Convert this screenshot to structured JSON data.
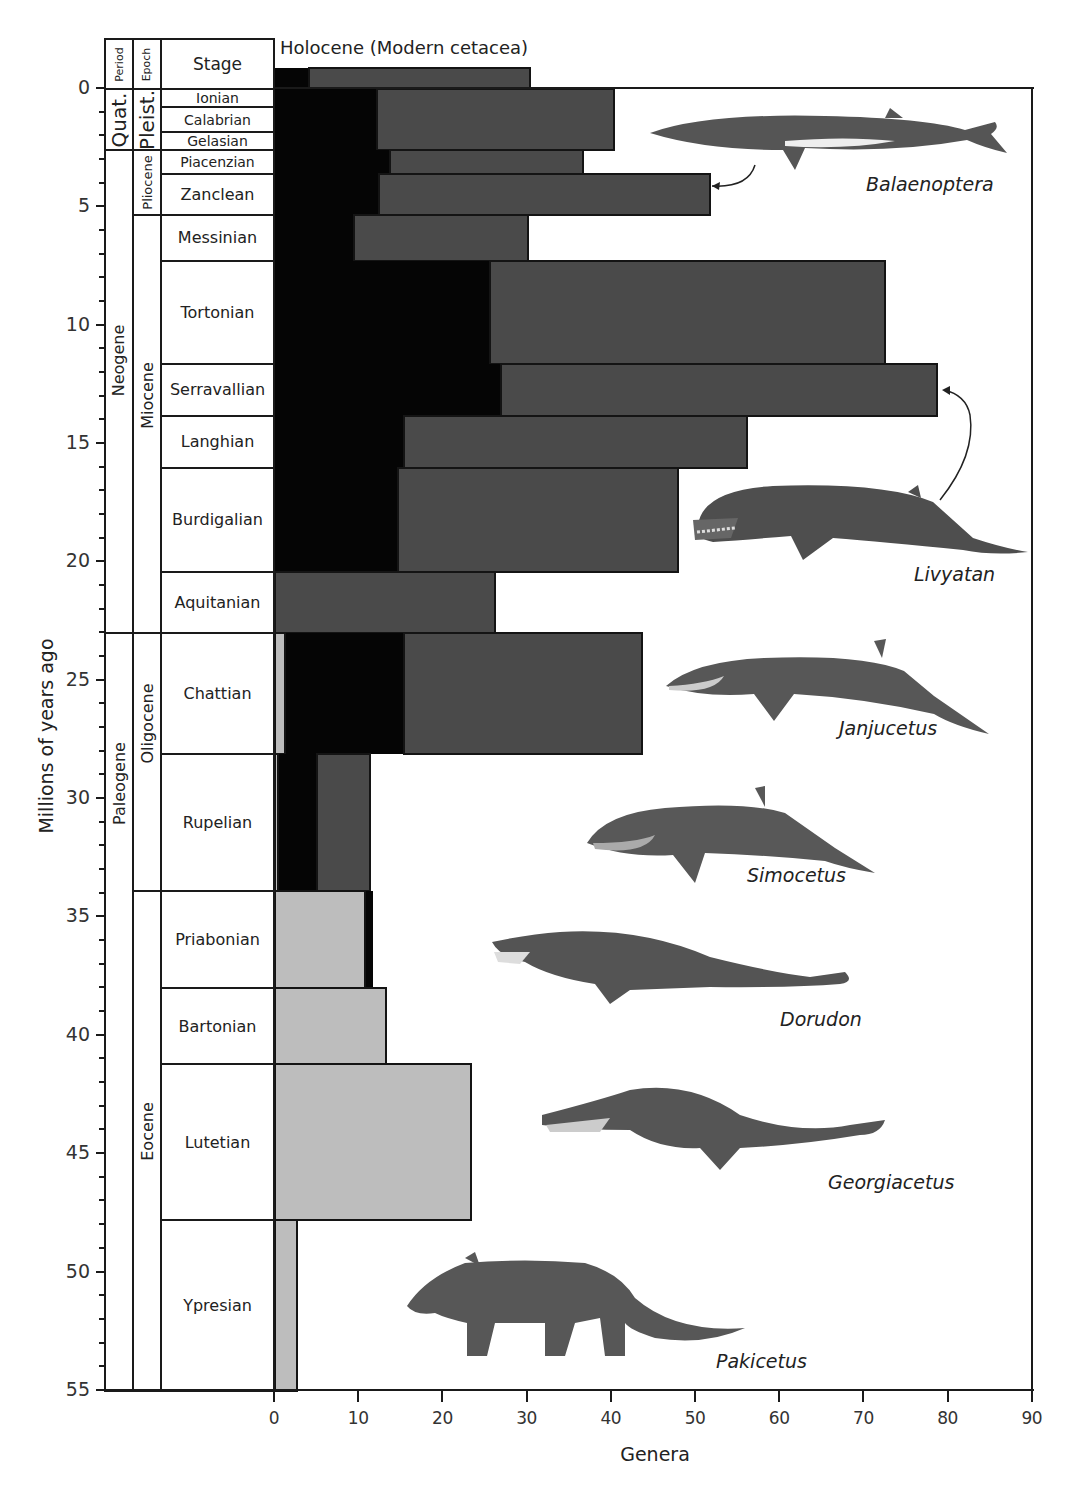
{
  "header": {
    "period_label": "Period",
    "epoch_label": "Epoch",
    "stage_label": "Stage",
    "holocene_label": "Holocene (Modern cetacea)"
  },
  "axes": {
    "y_title": "Millions of years ago",
    "x_title": "Genera",
    "y_ticks": [
      "0",
      "5",
      "10",
      "15",
      "20",
      "25",
      "30",
      "35",
      "40",
      "45",
      "50",
      "55"
    ],
    "x_ticks": [
      "0",
      "10",
      "20",
      "30",
      "40",
      "50",
      "60",
      "70",
      "80",
      "90"
    ]
  },
  "periods": [
    {
      "name": "Quat.",
      "start_ma": 0,
      "end_ma": 2.58
    },
    {
      "name": "Neogene",
      "start_ma": 2.58,
      "end_ma": 23.0
    },
    {
      "name": "Paleogene",
      "start_ma": 23.0,
      "end_ma": 55
    }
  ],
  "epochs": [
    {
      "name": "Pleist.",
      "start_ma": 0,
      "end_ma": 2.58
    },
    {
      "name": "Pliocene",
      "start_ma": 2.58,
      "end_ma": 5.33
    },
    {
      "name": "Miocene",
      "start_ma": 5.33,
      "end_ma": 23.0
    },
    {
      "name": "Oligocene",
      "start_ma": 23.0,
      "end_ma": 33.9
    },
    {
      "name": "Eocene",
      "start_ma": 33.9,
      "end_ma": 55
    }
  ],
  "species_labels": {
    "balaenoptera": "Balaenoptera",
    "livyatan": "Livyatan",
    "janjucetus": "Janjucetus",
    "simocetus": "Simocetus",
    "dorudon": "Dorudon",
    "georgiacetus": "Georgiacetus",
    "pakicetus": "Pakicetus"
  },
  "colors": {
    "odontoceti_dark_gray": "#4a4a4a",
    "mysticeti_black": "#050505",
    "archaeoceti_light_gray": "#bdbdbd"
  },
  "chart_data": {
    "type": "bar",
    "orientation": "horizontal-stacked",
    "title": "",
    "xlabel": "Genera",
    "ylabel": "Millions of years ago",
    "xlim": [
      0,
      90
    ],
    "ylim": [
      0,
      55
    ],
    "y_inverted": true,
    "grid": false,
    "legend": null,
    "series_order": [
      "light_gray",
      "black",
      "dark_gray"
    ],
    "categories": [
      "Holocene",
      "Ionian/Calabrian/Gelasian",
      "Piacenzian",
      "Zanclean",
      "Messinian",
      "Tortonian",
      "Serravallian",
      "Langhian",
      "Burdigalian",
      "Aquitanian",
      "Chattian",
      "Rupelian",
      "Priabonian",
      "Bartonian",
      "Lutetian",
      "Ypresian"
    ],
    "stage_ranges_ma": [
      [
        -0.9,
        0
      ],
      [
        0,
        2.58
      ],
      [
        2.58,
        3.6
      ],
      [
        3.6,
        5.33
      ],
      [
        5.33,
        7.25
      ],
      [
        7.25,
        11.6
      ],
      [
        11.6,
        13.8
      ],
      [
        13.8,
        16.0
      ],
      [
        16.0,
        20.4
      ],
      [
        20.4,
        23.0
      ],
      [
        23.0,
        28.1
      ],
      [
        28.1,
        33.9
      ],
      [
        33.9,
        38.0
      ],
      [
        38.0,
        41.2
      ],
      [
        41.2,
        47.8
      ],
      [
        47.8,
        55.0
      ]
    ],
    "series": [
      {
        "name": "light gray",
        "values": [
          0,
          0,
          0,
          0,
          0,
          0,
          0,
          0,
          0,
          0,
          1.2,
          0.4,
          10.7,
          13.2,
          23.3,
          2.6
        ]
      },
      {
        "name": "black",
        "values": [
          4.0,
          12.1,
          13.7,
          12.4,
          9.4,
          25.5,
          26.8,
          15.3,
          14.6,
          0,
          14.1,
          4.6,
          1.1,
          0,
          0,
          0
        ]
      },
      {
        "name": "dark gray",
        "values": [
          26.5,
          28.4,
          23.1,
          39.5,
          20.9,
          47.2,
          52.1,
          41.0,
          33.5,
          26.4,
          28.5,
          6.5,
          0,
          0,
          0,
          0
        ]
      }
    ],
    "totals": [
      30.5,
      40.5,
      36.8,
      51.9,
      30.3,
      72.7,
      78.9,
      56.3,
      48.1,
      26.4,
      43.8,
      11.5,
      11.8,
      13.2,
      23.3,
      2.6
    ],
    "stages": [
      {
        "name": "Ionian",
        "start_ma": 0,
        "end_ma": 0.78
      },
      {
        "name": "Calabrian",
        "start_ma": 0.78,
        "end_ma": 1.8
      },
      {
        "name": "Gelasian",
        "start_ma": 1.8,
        "end_ma": 2.58
      },
      {
        "name": "Piacenzian",
        "start_ma": 2.58,
        "end_ma": 3.6
      },
      {
        "name": "Zanclean",
        "start_ma": 3.6,
        "end_ma": 5.33
      },
      {
        "name": "Messinian",
        "start_ma": 5.33,
        "end_ma": 7.25
      },
      {
        "name": "Tortonian",
        "start_ma": 7.25,
        "end_ma": 11.6
      },
      {
        "name": "Serravallian",
        "start_ma": 11.6,
        "end_ma": 13.8
      },
      {
        "name": "Langhian",
        "start_ma": 13.8,
        "end_ma": 16.0
      },
      {
        "name": "Burdigalian",
        "start_ma": 16.0,
        "end_ma": 20.4
      },
      {
        "name": "Aquitanian",
        "start_ma": 20.4,
        "end_ma": 23.0
      },
      {
        "name": "Chattian",
        "start_ma": 23.0,
        "end_ma": 28.1
      },
      {
        "name": "Rupelian",
        "start_ma": 28.1,
        "end_ma": 33.9
      },
      {
        "name": "Priabonian",
        "start_ma": 33.9,
        "end_ma": 38.0
      },
      {
        "name": "Bartonian",
        "start_ma": 38.0,
        "end_ma": 41.2
      },
      {
        "name": "Lutetian",
        "start_ma": 41.2,
        "end_ma": 47.8
      },
      {
        "name": "Ypresian",
        "start_ma": 47.8,
        "end_ma": 55.0
      }
    ],
    "annotations": [
      "Holocene (Modern cetacea)",
      "Balaenoptera",
      "Livyatan",
      "Janjucetus",
      "Simocetus",
      "Dorudon",
      "Georgiacetus",
      "Pakicetus"
    ]
  }
}
